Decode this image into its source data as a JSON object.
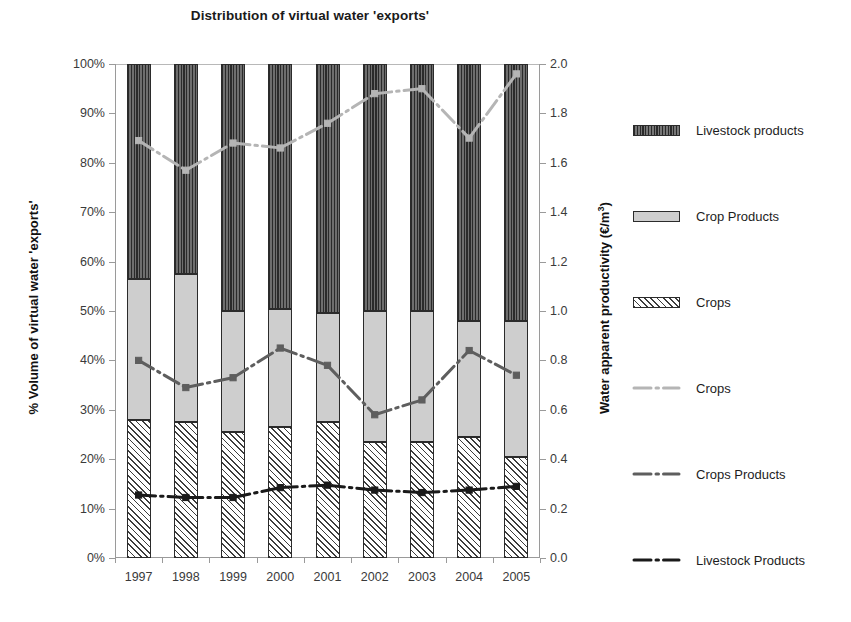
{
  "chart_data": {
    "type": "bar",
    "title": "Distribution of virtual water 'exports'",
    "subtitle": "",
    "xlabel": "",
    "ylabel": "% Volume of virtual water 'exports'",
    "y2label": "Water apparent productivity (€/m³)",
    "grid": false,
    "legend_position": "right",
    "stacked": true,
    "stack_total_percent": 100,
    "categories": [
      "1997",
      "1998",
      "1999",
      "2000",
      "2001",
      "2002",
      "2003",
      "2004",
      "2005"
    ],
    "ylim": [
      0,
      100
    ],
    "yticks": [
      0,
      10,
      20,
      30,
      40,
      50,
      60,
      70,
      80,
      90,
      100
    ],
    "ytick_labels": [
      "0%",
      "10%",
      "20%",
      "30%",
      "40%",
      "50%",
      "60%",
      "70%",
      "80%",
      "90%",
      "100%"
    ],
    "y2lim": [
      0,
      2.0
    ],
    "y2ticks": [
      0.0,
      0.2,
      0.4,
      0.6,
      0.8,
      1.0,
      1.2,
      1.4,
      1.6,
      1.8,
      2.0
    ],
    "y2tick_labels": [
      "0.0",
      "0.2",
      "0.4",
      "0.6",
      "0.8",
      "1.0",
      "1.2",
      "1.4",
      "1.6",
      "1.8",
      "2.0"
    ],
    "bar_series": [
      {
        "name": "Crops",
        "axis": "left",
        "unit": "%",
        "pattern": "diagonal-hatch",
        "color": "#ffffff",
        "values": [
          28.0,
          27.5,
          25.5,
          26.5,
          27.5,
          23.5,
          23.5,
          24.5,
          20.5
        ]
      },
      {
        "name": "Crop Products",
        "axis": "left",
        "unit": "%",
        "pattern": "solid-light-gray",
        "color": "#cecece",
        "values": [
          28.5,
          30.0,
          24.5,
          24.0,
          22.0,
          26.5,
          26.5,
          23.5,
          27.5
        ]
      },
      {
        "name": "Livestock products",
        "axis": "left",
        "unit": "%",
        "pattern": "vertical-hatch-dark",
        "color": "#4a4a4a",
        "values": [
          43.5,
          42.5,
          50.0,
          49.5,
          50.5,
          50.0,
          50.0,
          52.0,
          52.0
        ]
      }
    ],
    "line_series": [
      {
        "name": "Crops",
        "axis": "right",
        "unit": "€/m³",
        "style": "dash-dot",
        "color": "#b5b5b5",
        "values": [
          1.69,
          1.57,
          1.68,
          1.66,
          1.76,
          1.88,
          1.9,
          1.7,
          1.96
        ]
      },
      {
        "name": "Crops Products",
        "axis": "right",
        "unit": "€/m³",
        "style": "dash-dot",
        "color": "#5e5e5e",
        "values": [
          0.8,
          0.69,
          0.73,
          0.85,
          0.78,
          0.58,
          0.64,
          0.84,
          0.74
        ]
      },
      {
        "name": "Livestock Products",
        "axis": "right",
        "unit": "€/m³",
        "style": "dash-dot",
        "color": "#1a1a1a",
        "values": [
          0.255,
          0.245,
          0.245,
          0.285,
          0.295,
          0.275,
          0.265,
          0.275,
          0.29
        ]
      }
    ]
  },
  "title": "Distribution of virtual water 'exports'",
  "axes": {
    "left_title": "% Volume of virtual water 'exports'",
    "right_title_main": "Water apparent productivity (€/m",
    "right_title_sup": "3",
    "right_title_tail": ")"
  },
  "legend": {
    "bars": [
      {
        "label": "Livestock products",
        "swatch": "vertical-hatch-swatch"
      },
      {
        "label": "Crop Products",
        "swatch": "solid-gray-swatch"
      },
      {
        "label": "Crops",
        "swatch": "diagonal-hatch-swatch"
      }
    ],
    "lines": [
      {
        "label": "Crops",
        "swatch": "light-gray-dash-dot-line-icon"
      },
      {
        "label": "Crops Products",
        "swatch": "medium-gray-dash-dot-line-icon"
      },
      {
        "label": "Livestock Products",
        "swatch": "black-dash-dot-line-icon"
      }
    ]
  }
}
